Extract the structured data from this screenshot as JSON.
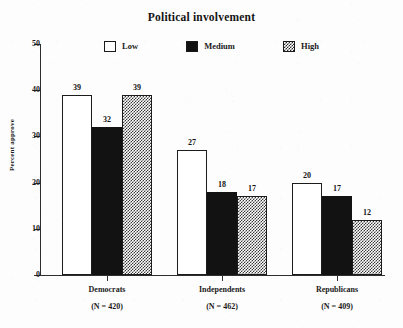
{
  "chart_data": {
    "type": "bar",
    "title": "Political involvement",
    "xlabel": "",
    "ylabel": "Percent approve",
    "ylim": [
      0,
      50
    ],
    "yticks": [
      0,
      10,
      20,
      30,
      40,
      50
    ],
    "grid": false,
    "legend_position": "top-center",
    "categories": [
      "Democrats",
      "Independents",
      "Republicans"
    ],
    "category_sublabels": [
      "(N = 420)",
      "(N = 462)",
      "(N = 409)"
    ],
    "series": [
      {
        "name": "Low",
        "values": [
          39,
          27,
          20
        ],
        "swatch": "white-outline"
      },
      {
        "name": "Medium",
        "values": [
          32,
          18,
          17
        ],
        "swatch": "solid-black"
      },
      {
        "name": "High",
        "values": [
          39,
          17,
          12
        ],
        "swatch": "checkered-gray"
      }
    ]
  },
  "legend": {
    "items": [
      {
        "label": "Low"
      },
      {
        "label": "Medium"
      },
      {
        "label": "High"
      }
    ]
  },
  "axes": {
    "y": {
      "title": "Percent approve",
      "ticks": [
        "0",
        "10",
        "20",
        "30",
        "40",
        "50"
      ]
    }
  },
  "colors": {
    "ink": "#1a1a1a",
    "axis": "#2e2e2e",
    "bar_medium": "#121212",
    "bar_high_pattern": "#3a3a3a",
    "background": "#fdfdfd"
  }
}
